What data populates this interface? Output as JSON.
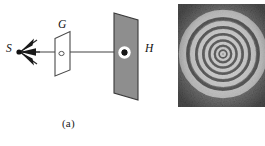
{
  "figure": {
    "type": "optics-diagram-with-photograph",
    "width": 265,
    "height": 146,
    "background_color": "#ffffff"
  },
  "panel_a": {
    "caption": "(a)",
    "description": "Ray diagram: point source S emitting a cone of rays through aperture plate G onto screen H",
    "labels": {
      "source": "S",
      "grating": "G",
      "screen": "H"
    },
    "elements": {
      "source_point_color": "#1a1a1a",
      "ray_color": "#9a9a9a",
      "grating_face_color": "#ffffff",
      "grating_edge_color": "#4a4a4a",
      "screen_face_color": "#8e8e8e",
      "screen_edge_color": "#3c3c3c",
      "hole_ring_color": "#ffffff",
      "hole_center_color": "#1a1a1a",
      "arrow_count": 3
    }
  },
  "panel_b": {
    "caption": "(b)",
    "description": "Photograph of circular interference fringes (Newton's rings / zone-plate pattern)",
    "photo": {
      "background_color": "#2f2f2f",
      "fringe_color": "#f2f2f2",
      "ring_count": 6,
      "ring_radii": [
        5,
        11,
        17,
        24,
        31,
        40
      ],
      "center_x": 45,
      "center_y": 50
    }
  },
  "colors": {
    "ink": "#1a1a1a",
    "ray": "#9a9a9a",
    "screen_gray": "#8e8e8e",
    "photo_dark": "#2f2f2f",
    "photo_light": "#f2f2f2"
  }
}
